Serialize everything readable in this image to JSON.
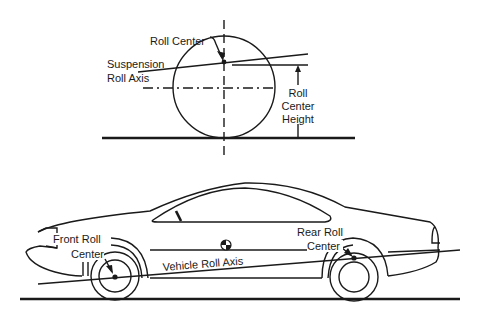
{
  "top_diagram": {
    "labels": {
      "roll_center": "Roll Center",
      "suspension_roll_axis_line1": "Suspension",
      "suspension_roll_axis_line2": "Roll Axis",
      "roll_center_height_line1": "Roll",
      "roll_center_height_line2": "Center",
      "roll_center_height_line3": "Height"
    }
  },
  "bottom_diagram": {
    "labels": {
      "front_roll_center_line1": "Front Roll",
      "front_roll_center_line2": "Center",
      "rear_roll_center_line1": "Rear Roll",
      "rear_roll_center_line2": "Center",
      "vehicle_roll_axis": "Vehicle Roll Axis"
    }
  },
  "colors": {
    "ink": "#1a1a1a",
    "background": "#ffffff"
  }
}
